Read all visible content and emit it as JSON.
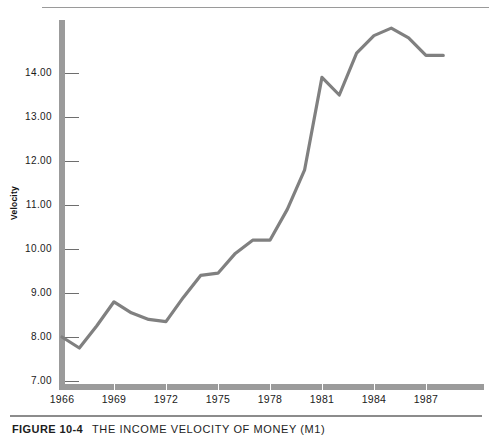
{
  "figure": {
    "label": "FIGURE 10-4",
    "title": "THE INCOME VELOCITY OF MONEY (M1)"
  },
  "chart_data": {
    "type": "line",
    "title": "THE INCOME VELOCITY OF MONEY (M1)",
    "xlabel": "",
    "ylabel": "Velocity",
    "xlim": [
      1966,
      1988
    ],
    "ylim": [
      6.5,
      15.3
    ],
    "grid": false,
    "legend": null,
    "line_color": "#808080",
    "x_tick_labels": [
      "1966",
      "1969",
      "1972",
      "1975",
      "1978",
      "1981",
      "1984",
      "1987"
    ],
    "x_ticks": [
      1966,
      1969,
      1972,
      1975,
      1978,
      1981,
      1984,
      1987
    ],
    "y_tick_labels": [
      "7.00",
      "8.00",
      "9.00",
      "10.00",
      "11.00",
      "12.00",
      "13.00",
      "14.00"
    ],
    "y_ticks": [
      7,
      8,
      9,
      10,
      11,
      12,
      13,
      14
    ],
    "x": [
      1966,
      1967,
      1968,
      1969,
      1970,
      1971,
      1972,
      1973,
      1974,
      1975,
      1976,
      1977,
      1978,
      1979,
      1980,
      1981,
      1982,
      1983,
      1984,
      1985,
      1986,
      1987,
      1988
    ],
    "values": [
      8.0,
      7.75,
      8.25,
      8.8,
      8.55,
      8.4,
      8.35,
      8.9,
      9.4,
      9.45,
      9.9,
      10.2,
      10.2,
      10.9,
      11.8,
      13.9,
      13.5,
      14.45,
      14.85,
      15.02,
      14.8,
      14.4,
      14.4
    ],
    "series": [
      {
        "name": "Velocity",
        "values": [
          8.0,
          7.75,
          8.25,
          8.8,
          8.55,
          8.4,
          8.35,
          8.9,
          9.4,
          9.45,
          9.9,
          10.2,
          10.2,
          10.9,
          11.8,
          13.9,
          13.5,
          14.45,
          14.85,
          15.02,
          14.8,
          14.4,
          14.4
        ]
      }
    ]
  }
}
